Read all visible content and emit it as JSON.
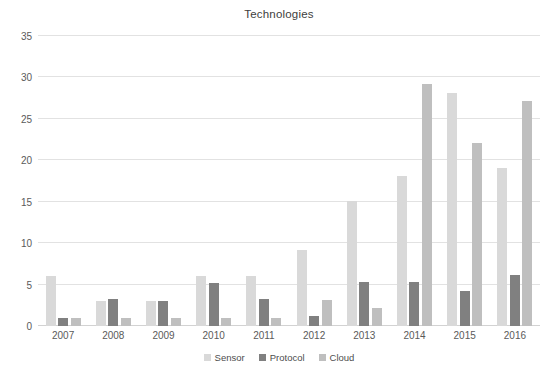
{
  "chart_data": {
    "type": "bar",
    "title": "Technologies",
    "xlabel": "",
    "ylabel": "",
    "ylim": [
      0,
      35
    ],
    "ytick_step": 5,
    "yticks": [
      0,
      5,
      10,
      15,
      20,
      25,
      30,
      35
    ],
    "grid": true,
    "legend_position": "bottom",
    "categories": [
      "2007",
      "2008",
      "2009",
      "2010",
      "2011",
      "2012",
      "2013",
      "2014",
      "2015",
      "2016"
    ],
    "series": [
      {
        "name": "Sensor",
        "color": "#d9d9d9",
        "values": [
          6.0,
          3.0,
          3.0,
          6.0,
          6.0,
          9.2,
          15.1,
          18.1,
          28.1,
          19.1
        ]
      },
      {
        "name": "Protocol",
        "color": "#808080",
        "values": [
          1.0,
          3.3,
          3.0,
          5.2,
          3.3,
          1.2,
          5.3,
          5.3,
          4.2,
          6.2
        ]
      },
      {
        "name": "Cloud",
        "color": "#bfbfbf",
        "values": [
          1.0,
          1.0,
          1.0,
          1.0,
          1.0,
          3.2,
          2.2,
          29.2,
          22.1,
          27.1
        ]
      }
    ]
  },
  "colors": {
    "sensor": "#d9d9d9",
    "protocol": "#808080",
    "cloud": "#bfbfbf",
    "gridline": "#e2e2e2",
    "text": "#5a5a5a",
    "background": "#ffffff"
  }
}
